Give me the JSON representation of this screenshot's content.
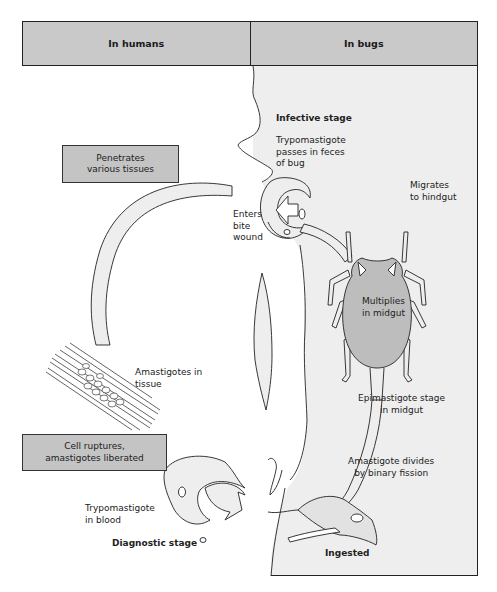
{
  "header": {
    "left_title": "In humans",
    "right_title": "In bugs"
  },
  "colors": {
    "header_fill": "#c9c9c9",
    "box_fill": "#c4c4c4",
    "bug_panel_fill": "#eeeeee",
    "bug_body_fill": "#bdbdbd",
    "outline": "#222222"
  },
  "boxes": {
    "penetrates": [
      "Penetrates",
      "various tissues"
    ],
    "cell_ruptures": [
      "Cell ruptures,",
      "amastigotes liberated"
    ]
  },
  "labels": {
    "infective_stage": "Infective stage",
    "trypomastigote_feces": [
      "Trypomastigote",
      "passes in feces",
      "of bug"
    ],
    "enters_bite_wound": [
      "Enters",
      "bite",
      "wound"
    ],
    "migrates_hindgut": [
      "Migrates",
      "to hindgut"
    ],
    "multiplies_midgut": [
      "Multiplies",
      "in midgut"
    ],
    "amastigotes_tissue": [
      "Amastigotes in",
      "tissue"
    ],
    "epimastigote_stage": [
      "Epimastigote stage",
      "in midgut"
    ],
    "amastigote_divides": [
      "Amastigote divides",
      "by binary fission"
    ],
    "trypomastigote_blood": [
      "Trypomastigote",
      "in blood"
    ],
    "diagnostic_stage": "Diagnostic stage",
    "ingested": "Ingested"
  }
}
